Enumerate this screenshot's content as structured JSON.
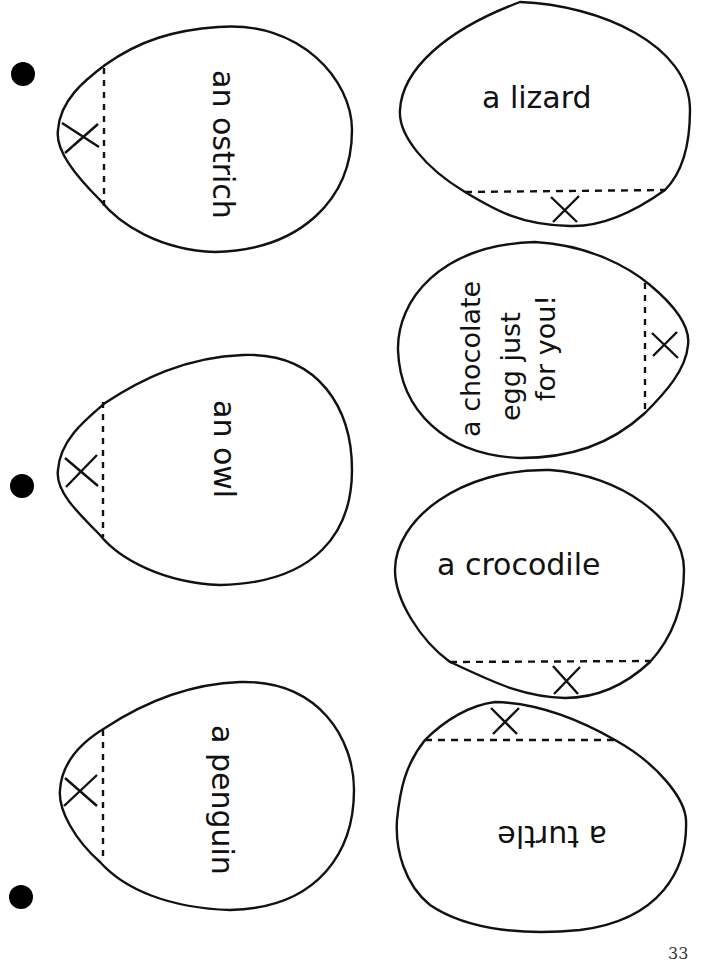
{
  "page": {
    "type": "printable cut-out worksheet",
    "page_number": "33"
  },
  "punch_holes": 3,
  "eggs": [
    {
      "id": "ostrich",
      "label": "an ostrich",
      "column": "left",
      "orientation": "rotated 90° clockwise",
      "fold_mark": "X"
    },
    {
      "id": "owl",
      "label": "an owl",
      "column": "left",
      "orientation": "rotated 90° clockwise",
      "fold_mark": "X"
    },
    {
      "id": "penguin",
      "label": "a penguin",
      "column": "left",
      "orientation": "rotated 90° clockwise",
      "fold_mark": "X"
    },
    {
      "id": "lizard",
      "label": "a lizard",
      "column": "right",
      "orientation": "upright",
      "fold_mark": "X"
    },
    {
      "id": "chocolate",
      "label_lines": [
        "a chocolate",
        "egg just",
        "for you!"
      ],
      "column": "right",
      "orientation": "rotated 90° counter-clockwise",
      "fold_mark": "X"
    },
    {
      "id": "crocodile",
      "label": "a crocodile",
      "column": "right",
      "orientation": "upright",
      "fold_mark": "X"
    },
    {
      "id": "turtle",
      "label": "a turtle",
      "column": "right",
      "orientation": "upside down",
      "fold_mark": "X"
    }
  ]
}
